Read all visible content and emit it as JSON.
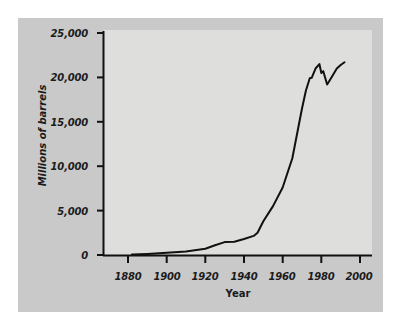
{
  "figure": {
    "background_color": "#ffffff",
    "card_color": "#c9c9c9",
    "plot_background_color": "#dededd",
    "line_color": "#111111",
    "axis_color": "#111111"
  },
  "chart_data": {
    "type": "line",
    "title": "",
    "subtitle": "",
    "xlabel": "Year",
    "ylabel": "Millions of barrels",
    "xlim": [
      1872,
      2004
    ],
    "ylim": [
      0,
      25000
    ],
    "xticks": [
      1880,
      1900,
      1920,
      1940,
      1960,
      1980,
      2000
    ],
    "xticklabels": [
      "1880",
      "1900",
      "1920",
      "1940",
      "1960",
      "1980",
      "2000"
    ],
    "yticks": [
      0,
      5000,
      10000,
      15000,
      20000,
      25000
    ],
    "yticklabels": [
      "0",
      "5,000",
      "10,000",
      "15,000",
      "20,000",
      "25,000"
    ],
    "grid": false,
    "legend": false,
    "legend_position": "none",
    "series": [
      {
        "name": "World crude oil production",
        "x": [
          1882,
          1890,
          1900,
          1910,
          1920,
          1925,
          1930,
          1935,
          1940,
          1945,
          1947,
          1950,
          1955,
          1960,
          1965,
          1970,
          1972,
          1974,
          1975,
          1977,
          1979,
          1980,
          1981,
          1983,
          1985,
          1988,
          1990,
          1992
        ],
        "values": [
          50,
          120,
          250,
          400,
          700,
          1100,
          1450,
          1500,
          1800,
          2150,
          2500,
          3800,
          5500,
          7600,
          10900,
          16500,
          18500,
          19900,
          19950,
          21000,
          21500,
          20500,
          20700,
          19200,
          19900,
          21000,
          21400,
          21700
        ]
      }
    ]
  }
}
